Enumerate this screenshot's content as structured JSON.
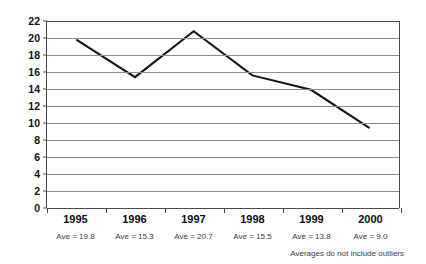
{
  "chart_data": {
    "type": "line",
    "title": "",
    "subtitle": "",
    "xlabel": "",
    "ylabel": "",
    "categories": [
      "1995",
      "1996",
      "1997",
      "1998",
      "1999",
      "2000"
    ],
    "values": [
      19.8,
      15.4,
      20.8,
      15.6,
      13.9,
      9.4
    ],
    "series": [
      {
        "name": "",
        "values": [
          19.8,
          15.4,
          20.8,
          15.6,
          13.9,
          9.4
        ]
      }
    ],
    "point_labels": [
      "Ave = 19.8",
      "Ave = 15.3",
      "Ave = 20.7",
      "Ave = 15.5",
      "Ave = 13.8",
      "Ave = 9.0"
    ],
    "averages": [
      19.8,
      15.3,
      20.7,
      15.5,
      13.8,
      9.0
    ],
    "ylim": [
      0,
      22
    ],
    "ytick_step": 2,
    "yticks": [
      22,
      20,
      18,
      16,
      14,
      12,
      10,
      8,
      6,
      4,
      2,
      0
    ],
    "grid": "horizontal",
    "legend": "none",
    "annotations": [
      "Averages do not include outliers"
    ],
    "line_color": "#141414",
    "grid_color": "#8e8e8e",
    "axis_color": "#4a4a4a",
    "background": "#ffffff"
  },
  "footnote": "Averages do not include outliers"
}
